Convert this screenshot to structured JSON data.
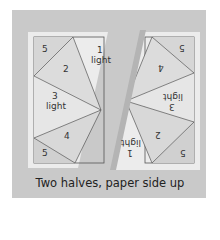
{
  "left_half": {
    "pieces": [
      {
        "number": "5",
        "label": ""
      },
      {
        "number": "1",
        "label": "light"
      },
      {
        "number": "2",
        "label": ""
      },
      {
        "number": "3",
        "label": "light"
      },
      {
        "number": "4",
        "label": ""
      },
      {
        "number": "5",
        "label": ""
      }
    ]
  },
  "right_half": {
    "pieces": [
      {
        "number": "5",
        "label": ""
      },
      {
        "number": "4",
        "label": ""
      },
      {
        "number": "3",
        "label": "light"
      },
      {
        "number": "2",
        "label": ""
      },
      {
        "number": "1",
        "label": "light"
      },
      {
        "number": "5",
        "label": ""
      }
    ]
  },
  "caption": "Two halves, paper side up",
  "colors": {
    "background": "#c9c9c9",
    "paper": "#ececec",
    "shaded": "#d8d8d8",
    "line": "#555555"
  }
}
